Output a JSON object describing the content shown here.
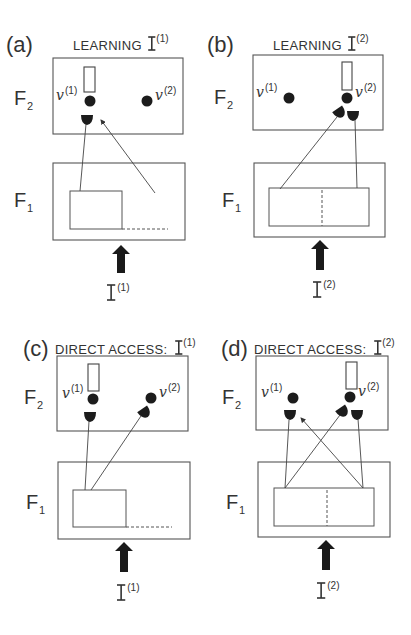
{
  "figure": {
    "width": 411,
    "height": 635,
    "colors": {
      "stroke": "#555555",
      "fill_dark": "#1c1c1c",
      "background": "#ffffff"
    }
  },
  "panels": [
    {
      "id": "a",
      "letter": "(a)",
      "title": "LEARNING",
      "input_symbol": "I",
      "input_index": "(1)",
      "letter_pos": [
        6,
        52
      ],
      "title_pos": [
        73,
        50
      ],
      "layer_f2": {
        "label": "F",
        "sub": "2",
        "pos": [
          14,
          105
        ]
      },
      "layer_f1": {
        "label": "F",
        "sub": "1",
        "pos": [
          14,
          207
        ]
      },
      "f2_box": [
        53,
        58,
        130,
        76
      ],
      "f1_box": [
        53,
        163,
        132,
        77
      ],
      "f1_inner": [
        70,
        191,
        52,
        38
      ],
      "f1_dash_h": [
        122,
        229,
        168,
        229
      ],
      "f1_dash_v": null,
      "nodes": [
        {
          "label": "v",
          "index": "(1)",
          "cx": 90,
          "cy": 101,
          "label_pos": [
            56,
            100
          ],
          "bar": [
            84,
            67,
            11,
            25
          ]
        },
        {
          "label": "v",
          "index": "(2)",
          "cx": 147,
          "cy": 101,
          "label_pos": [
            155,
            100
          ],
          "bar": null
        }
      ],
      "cups": [
        {
          "x": 87,
          "y": 117,
          "rot": 0
        }
      ],
      "wires": [
        [
          86,
          124,
          80,
          191
        ]
      ],
      "arrow_wires": [
        [
          155,
          193,
          101,
          120
        ]
      ],
      "input_arrow": {
        "x": 121,
        "y1": 245,
        "y2": 273
      },
      "input_label_pos": [
        107,
        300
      ]
    },
    {
      "id": "b",
      "letter": "(b)",
      "title": "LEARNING",
      "input_symbol": "I",
      "input_index": "(2)",
      "letter_pos": [
        207,
        52
      ],
      "title_pos": [
        273,
        50
      ],
      "layer_f2": {
        "label": "F",
        "sub": "2",
        "pos": [
          214,
          104
        ]
      },
      "layer_f1": {
        "label": "F",
        "sub": "1",
        "pos": [
          222,
          207
        ]
      },
      "f2_box": [
        253,
        55,
        130,
        75
      ],
      "f1_box": [
        254,
        163,
        131,
        74
      ],
      "f1_inner": [
        269,
        188,
        100,
        38
      ],
      "f1_dash_h": null,
      "f1_dash_v": [
        322,
        190,
        322,
        226
      ],
      "nodes": [
        {
          "label": "v",
          "index": "(1)",
          "cx": 289,
          "cy": 98,
          "label_pos": [
            256,
            97
          ],
          "bar": [
            342,
            62,
            10,
            28
          ]
        },
        {
          "label": "v",
          "index": "(2)",
          "cx": 347,
          "cy": 98,
          "label_pos": [
            355,
            97
          ],
          "bar": null
        }
      ],
      "cups": [
        {
          "x": 340,
          "y": 110,
          "rot": -35
        },
        {
          "x": 353,
          "y": 113,
          "rot": 0
        }
      ],
      "wires": [
        [
          337,
          117,
          280,
          189
        ],
        [
          355,
          120,
          357,
          188
        ]
      ],
      "arrow_wires": [],
      "input_arrow": {
        "x": 320,
        "y1": 240,
        "y2": 270
      },
      "input_label_pos": [
        313,
        297
      ]
    },
    {
      "id": "c",
      "letter": "(c)",
      "title": "DIRECT ACCESS:",
      "input_symbol": "I",
      "input_index": "(1)",
      "letter_pos": [
        23,
        356
      ],
      "title_pos": [
        55,
        354
      ],
      "layer_f2": {
        "label": "F",
        "sub": "2",
        "pos": [
          24,
          404
        ]
      },
      "layer_f1": {
        "label": "F",
        "sub": "1",
        "pos": [
          26,
          509
        ]
      },
      "f2_box": [
        57,
        356,
        131,
        75
      ],
      "f1_box": [
        58,
        462,
        132,
        77
      ],
      "f1_inner": [
        73,
        490,
        53,
        37
      ],
      "f1_dash_h": [
        126,
        527,
        172,
        527
      ],
      "f1_dash_v": null,
      "nodes": [
        {
          "label": "v",
          "index": "(1)",
          "cx": 93,
          "cy": 399,
          "label_pos": [
            62,
            398
          ],
          "bar": [
            88,
            364,
            11,
            27
          ]
        },
        {
          "label": "v",
          "index": "(2)",
          "cx": 151,
          "cy": 398,
          "label_pos": [
            159,
            397
          ],
          "bar": null
        }
      ],
      "cups": [
        {
          "x": 90,
          "y": 414,
          "rot": 0
        },
        {
          "x": 145,
          "y": 410,
          "rot": -35
        }
      ],
      "wires": [
        [
          89,
          421,
          85,
          490
        ],
        [
          141,
          416,
          91,
          490
        ]
      ],
      "arrow_wires": [],
      "input_arrow": {
        "x": 124,
        "y1": 542,
        "y2": 572
      },
      "input_label_pos": [
        117,
        600
      ]
    },
    {
      "id": "d",
      "letter": "(d)",
      "title": "DIRECT ACCESS:",
      "input_symbol": "I",
      "input_index": "(2)",
      "letter_pos": [
        221,
        356
      ],
      "title_pos": [
        254,
        354
      ],
      "layer_f2": {
        "label": "F",
        "sub": "2",
        "pos": [
          222,
          404
        ]
      },
      "layer_f1": {
        "label": "F",
        "sub": "1",
        "pos": [
          226,
          509
        ]
      },
      "f2_box": [
        256,
        356,
        132,
        74
      ],
      "f1_box": [
        258,
        462,
        132,
        75
      ],
      "f1_inner": [
        274,
        488,
        100,
        38
      ],
      "f1_dash_h": null,
      "f1_dash_v": [
        327,
        490,
        327,
        526
      ],
      "nodes": [
        {
          "label": "v",
          "index": "(1)",
          "cx": 293,
          "cy": 398,
          "label_pos": [
            261,
            397
          ],
          "bar": [
            346,
            362,
            11,
            27
          ]
        },
        {
          "label": "v",
          "index": "(2)",
          "cx": 350,
          "cy": 397,
          "label_pos": [
            358,
            396
          ],
          "bar": null
        }
      ],
      "cups": [
        {
          "x": 290,
          "y": 412,
          "rot": 0
        },
        {
          "x": 343,
          "y": 409,
          "rot": -35
        },
        {
          "x": 357,
          "y": 412,
          "rot": 0
        }
      ],
      "wires": [
        [
          289,
          420,
          285,
          488
        ],
        [
          340,
          415,
          285,
          488
        ],
        [
          358,
          419,
          363,
          488
        ]
      ],
      "arrow_wires": [
        [
          363,
          488,
          301,
          418
        ]
      ],
      "input_arrow": {
        "x": 326,
        "y1": 540,
        "y2": 570
      },
      "input_label_pos": [
        317,
        598
      ]
    }
  ]
}
